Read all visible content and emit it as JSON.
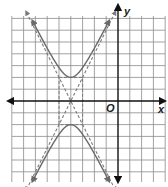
{
  "chart_data": {
    "type": "line",
    "title": "",
    "xlabel": "x",
    "ylabel": "y",
    "origin_label": "O",
    "grid": true,
    "xlim": [
      -9,
      4
    ],
    "ylim": [
      -7,
      7
    ],
    "tick_labels": false,
    "series": [
      {
        "name": "hyperbola",
        "equation": "y^2/4 - (x+4)^2/1 = 1",
        "style": "solid",
        "center": [
          -4,
          0
        ],
        "a": 2,
        "b": 1,
        "vertices": [
          [
            -4,
            2
          ],
          [
            -4,
            -2
          ]
        ],
        "orientation": "vertical"
      },
      {
        "name": "asymptote-1",
        "equation": "y = 2(x+4)",
        "style": "dashed"
      },
      {
        "name": "asymptote-2",
        "equation": "y = -2(x+4)",
        "style": "dashed"
      },
      {
        "name": "central-rectangle",
        "style": "dashed",
        "corners": [
          [
            -5,
            2
          ],
          [
            -3,
            2
          ],
          [
            -3,
            -2
          ],
          [
            -5,
            -2
          ]
        ]
      }
    ]
  },
  "style": {
    "grid_color": "#8a8a8a",
    "axis_color": "#111111",
    "curve_color": "#6a6a6a",
    "dash_color": "#7a7a7a"
  }
}
